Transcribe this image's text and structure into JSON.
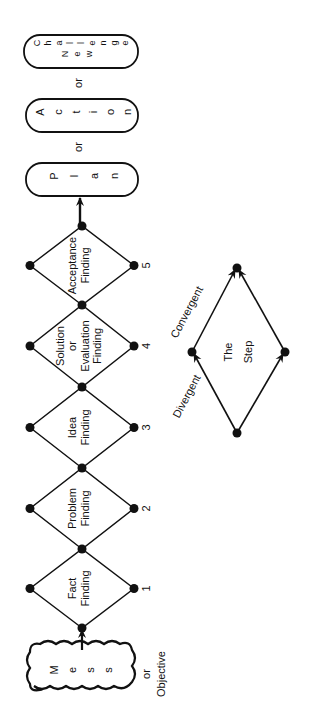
{
  "diagram": {
    "orientation": "rotated -90 degrees",
    "start": {
      "label_letters": [
        "M",
        "e",
        "s",
        "s"
      ],
      "label": "Mess",
      "alt_prefix": "or",
      "alt_label": "Objective"
    },
    "steps": [
      {
        "number": "1",
        "lines": [
          "Fact",
          "Finding"
        ]
      },
      {
        "number": "2",
        "lines": [
          "Problem",
          "Finding"
        ]
      },
      {
        "number": "3",
        "lines": [
          "Idea",
          "Finding"
        ]
      },
      {
        "number": "4",
        "lines": [
          "Solution",
          "or",
          "Evaluation",
          "Finding"
        ]
      },
      {
        "number": "5",
        "lines": [
          "Acceptance",
          "Finding"
        ]
      }
    ],
    "outcomes": [
      {
        "label": "Plan",
        "letters": [
          "P",
          "l",
          "a",
          "n"
        ]
      },
      {
        "label": "Action",
        "letters": [
          "A",
          "c",
          "t",
          "i",
          "o",
          "n"
        ]
      },
      {
        "label": "New Challenge",
        "line1": [
          "N",
          "e",
          "w"
        ],
        "line2": [
          "C",
          "h",
          "a",
          "l",
          "l",
          "e",
          "n",
          "g",
          "e"
        ]
      }
    ],
    "outcome_separator": "or",
    "legend": {
      "lines": [
        "The",
        "Step"
      ],
      "divergent_label": "Divergent",
      "convergent_label": "Convergent"
    },
    "colors": {
      "ink": "#111111",
      "background": "#ffffff"
    }
  }
}
